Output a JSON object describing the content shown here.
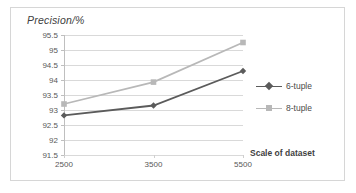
{
  "chart_data": {
    "type": "line",
    "title": "Precision/%",
    "xlabel": "Scale of dataset",
    "ylabel": "Precision/%",
    "categories": [
      "2500",
      "3500",
      "5500"
    ],
    "x": [
      2500,
      3500,
      5500
    ],
    "series": [
      {
        "name": "6-tuple",
        "values": [
          92.82,
          93.15,
          94.3
        ],
        "color": "#5b5b5b",
        "marker": "diamond"
      },
      {
        "name": "8-tuple",
        "values": [
          93.2,
          93.93,
          95.25
        ],
        "color": "#b8b8b8",
        "marker": "square"
      }
    ],
    "ylim": [
      91.5,
      95.5
    ],
    "yticks": [
      "91.5",
      "92",
      "92.5",
      "93",
      "93.5",
      "94",
      "94.5",
      "95",
      "95.5"
    ],
    "ytick_values": [
      91.5,
      92,
      92.5,
      93,
      93.5,
      94,
      94.5,
      95,
      95.5
    ],
    "xticks": [
      "2500",
      "3500",
      "5500"
    ],
    "grid": "horizontal",
    "legend_position": "right"
  },
  "legend": {
    "items": [
      {
        "label": "6-tuple",
        "color": "#5b5b5b",
        "marker": "diamond"
      },
      {
        "label": "8-tuple",
        "color": "#b8b8b8",
        "marker": "square"
      }
    ]
  },
  "colors": {
    "series_6tuple": "#5b5b5b",
    "series_8tuple": "#b8b8b8",
    "gridline": "#d9d9d9",
    "axis": "#bfbfbf",
    "border": "#d6d6d6",
    "text": "#585858",
    "background": "#ffffff"
  }
}
